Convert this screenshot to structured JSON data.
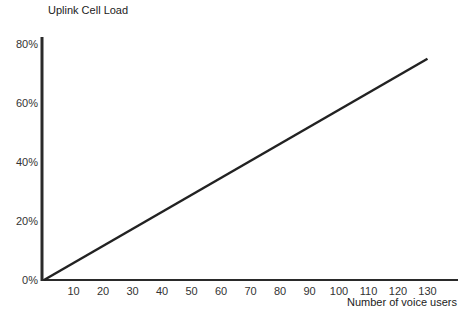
{
  "chart_data": {
    "type": "line",
    "title": "",
    "ylabel": "Uplink Cell Load",
    "xlabel": "Number of voice users",
    "x_ticks": [
      10,
      20,
      30,
      40,
      50,
      60,
      70,
      80,
      90,
      100,
      110,
      120,
      130
    ],
    "y_ticks": [
      "0%",
      "20%",
      "40%",
      "60%",
      "80%"
    ],
    "y_tick_values": [
      0,
      20,
      40,
      60,
      80
    ],
    "xlim": [
      0,
      135
    ],
    "ylim": [
      0,
      85
    ],
    "grid": false,
    "series": [
      {
        "name": "Uplink Cell Load",
        "color": "#222222",
        "x": [
          0,
          130
        ],
        "y": [
          0,
          75
        ]
      }
    ]
  }
}
